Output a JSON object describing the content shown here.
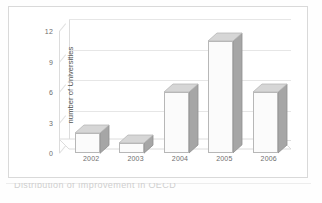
{
  "figure": {
    "background_color": "#fefefe",
    "frame_color": "#d9d9d9"
  },
  "chart_data": {
    "type": "bar",
    "title": "",
    "subtitle": "",
    "xlabel": "",
    "ylabel": "number of Universities",
    "categories": [
      "2002",
      "2003",
      "2004",
      "2005",
      "2006"
    ],
    "values": [
      2,
      1,
      6,
      11,
      6
    ],
    "series": [
      {
        "name": "number of Universities",
        "values": [
          2,
          1,
          6,
          11,
          6
        ]
      }
    ],
    "ylim": [
      0,
      12
    ],
    "yticks": [
      0,
      3,
      6,
      9,
      12
    ],
    "ytick_labels": [
      "0",
      "3",
      "6",
      "9",
      "12"
    ],
    "xtick_labels": [
      "2002",
      "2003",
      "2004",
      "2005",
      "2006"
    ],
    "grid": true,
    "grid_axis": "y",
    "legend": false,
    "legend_position": "none",
    "three_d": true,
    "bar_face_color": "#fbfbfb",
    "bar_side_color": "#a6a6a6",
    "bar_top_color": "#d6d6d6",
    "bar_edge_color": "#b7b7b7",
    "gridline_color": "#e6e6e6",
    "axis_color": "#dcdcdc",
    "tick_text_color": "#6e6e6e"
  },
  "caption": {
    "text": "Distribution of ımprovement in       OECD"
  }
}
